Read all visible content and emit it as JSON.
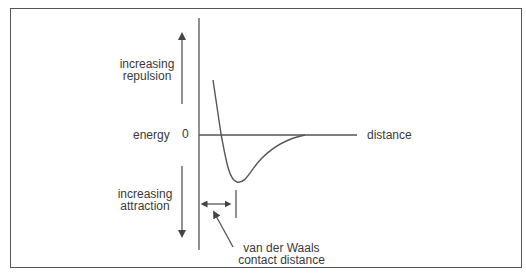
{
  "diagram": {
    "type": "potential-energy-curve",
    "title": "",
    "y_axis": {
      "label": "energy",
      "zero_label": "0",
      "up_arrow_label": [
        "increasing",
        "repulsion"
      ],
      "down_arrow_label": [
        "increasing",
        "attraction"
      ]
    },
    "x_axis": {
      "label": "distance"
    },
    "annotation": {
      "text": [
        "van der Waals",
        "contact distance"
      ],
      "points_to": "double-headed arrow marking distance from axis to energy minimum"
    },
    "colors": {
      "line": "#555555",
      "text": "#3a3a3a",
      "background": "#ffffff"
    }
  }
}
